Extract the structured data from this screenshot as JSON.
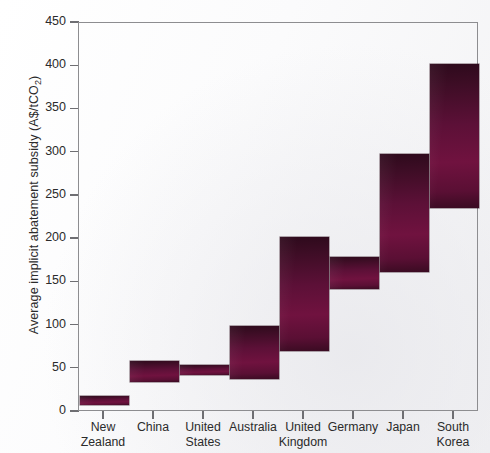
{
  "chart_data": {
    "type": "bar",
    "bar_style": "floating-range-bar",
    "title": "",
    "xlabel": "",
    "ylabel": "Average implicit abatement subsidy (A$/tCO2)",
    "ylabel_parts": {
      "main": "Average implicit abatement subsidy (A$/tCO",
      "sub": "2",
      "tail": ")"
    },
    "ylim": [
      0,
      450
    ],
    "yticks": [
      0,
      50,
      100,
      150,
      200,
      250,
      300,
      350,
      400,
      450
    ],
    "ytick_labels": [
      "0",
      "50",
      "100",
      "150",
      "200",
      "250",
      "300",
      "350",
      "400",
      "450"
    ],
    "grid": false,
    "legend": null,
    "categories": [
      "New Zealand",
      "China",
      "United States",
      "Australia",
      "United Kingdom",
      "Germany",
      "Japan",
      "South Korea"
    ],
    "category_lines": [
      [
        "New",
        "Zealand"
      ],
      [
        "China",
        ""
      ],
      [
        "United",
        "States"
      ],
      [
        "Australia",
        ""
      ],
      [
        "United",
        "Kingdom"
      ],
      [
        "Germany",
        ""
      ],
      [
        "Japan",
        ""
      ],
      [
        "South",
        "Korea"
      ]
    ],
    "low": [
      8,
      35,
      43,
      38,
      70,
      142,
      162,
      236
    ],
    "high": [
      18,
      59,
      54,
      100,
      202,
      179,
      298,
      402
    ],
    "series": [
      {
        "name": "range low (A$/tCO2)",
        "values": [
          8,
          35,
          43,
          38,
          70,
          142,
          162,
          236
        ]
      },
      {
        "name": "range high (A$/tCO2)",
        "values": [
          18,
          59,
          54,
          100,
          202,
          179,
          298,
          402
        ]
      }
    ],
    "bar_color": "#5c1037",
    "bar_color_dark": "#2e0a1c",
    "axis_color": "#8d8d90",
    "text_color": "#2b2b2b"
  }
}
